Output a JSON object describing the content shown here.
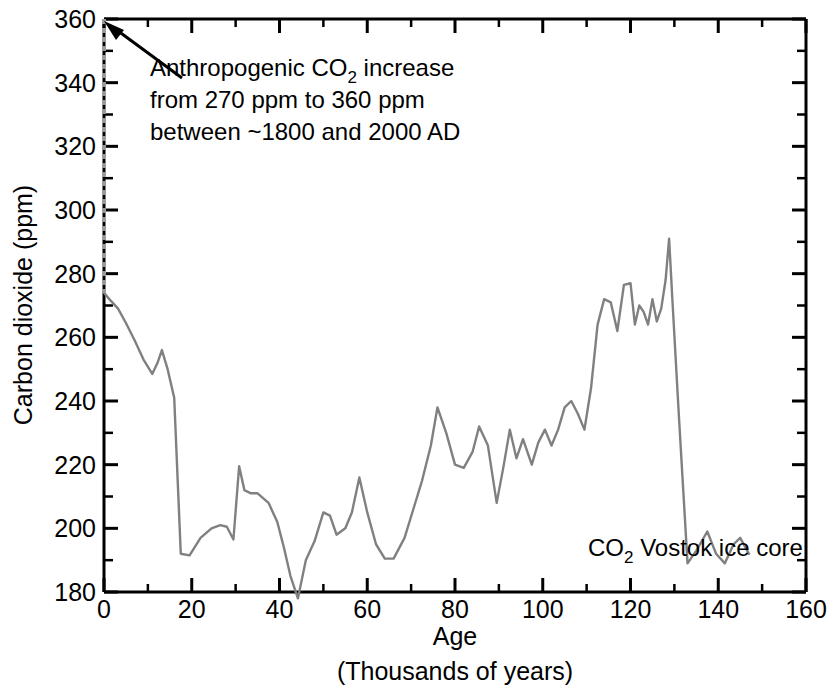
{
  "chart_data": {
    "type": "line",
    "title": "",
    "xlabel": "Age",
    "xlabel_sub": "(Thousands of years)",
    "ylabel_pre": "Carbon dioxide (ppm)",
    "xlim": [
      0,
      160
    ],
    "ylim": [
      180,
      360
    ],
    "x_major_ticks": [
      0,
      20,
      40,
      60,
      80,
      100,
      120,
      140,
      160
    ],
    "x_tick_labels": [
      "0",
      "20",
      "40",
      "60",
      "80",
      "100",
      "120",
      "140",
      "160"
    ],
    "x_minor_step": 10,
    "y_major_ticks": [
      180,
      200,
      220,
      240,
      260,
      280,
      300,
      320,
      340,
      360
    ],
    "y_tick_labels": [
      "180",
      "200",
      "220",
      "240",
      "260",
      "280",
      "300",
      "320",
      "340",
      "360"
    ],
    "y_minor_step": 10,
    "grid": false,
    "legend_position": "inside-bottom-right",
    "line_color": "#808080",
    "axis_color": "#000000",
    "series": [
      {
        "name": "CO2 Vostok ice core",
        "name_display_pre": "CO",
        "name_display_sub": "2",
        "name_display_post": " Vostok ice core",
        "x": [
          0.0,
          1.2,
          3.2,
          5.0,
          7.0,
          9.0,
          11.0,
          12.2,
          13.2,
          14.5,
          16.0,
          17.5,
          19.5,
          22.0,
          24.5,
          26.5,
          28.0,
          29.5,
          30.8,
          32.0,
          33.5,
          35.0,
          37.5,
          39.5,
          41.0,
          42.5,
          44.2,
          46.0,
          48.0,
          50.0,
          51.5,
          53.0,
          55.0,
          56.5,
          58.2,
          60.0,
          62.0,
          64.0,
          66.0,
          68.5,
          70.5,
          72.5,
          74.5,
          76.0,
          78.0,
          80.0,
          82.0,
          84.0,
          85.5,
          87.5,
          89.5,
          91.0,
          92.5,
          94.0,
          95.5,
          97.5,
          99.0,
          100.5,
          102.0,
          103.5,
          105.0,
          106.5,
          108.0,
          109.5,
          111.0,
          112.5,
          114.0,
          115.5,
          117.0,
          118.5,
          120.0,
          121.0,
          122.0,
          123.0,
          124.0,
          125.0,
          126.0,
          127.0,
          128.0,
          128.8,
          129.5,
          131.0,
          133.0,
          135.0,
          137.5,
          139.5,
          141.5,
          143.5,
          145.0,
          147.0
        ],
        "y": [
          274.0,
          272.0,
          269.0,
          264.5,
          259.0,
          253.0,
          248.5,
          252.0,
          256.0,
          250.0,
          241.0,
          192.0,
          191.5,
          197.0,
          200.0,
          201.0,
          200.5,
          196.5,
          219.5,
          212.0,
          211.0,
          211.0,
          208.0,
          202.0,
          194.0,
          185.0,
          178.0,
          190.0,
          196.0,
          205.0,
          204.0,
          198.0,
          200.0,
          205.0,
          216.0,
          205.0,
          195.0,
          190.5,
          190.5,
          197.0,
          206.0,
          215.0,
          226.0,
          238.0,
          230.0,
          220.0,
          219.0,
          224.0,
          232.0,
          226.0,
          208.0,
          219.0,
          231.0,
          222.0,
          228.0,
          220.0,
          227.0,
          231.0,
          226.0,
          231.0,
          238.0,
          240.0,
          236.0,
          231.0,
          244.0,
          264.0,
          272.0,
          271.0,
          262.0,
          276.5,
          277.0,
          264.0,
          270.0,
          268.0,
          264.0,
          272.0,
          265.0,
          269.0,
          278.0,
          291.0,
          273.0,
          236.0,
          189.0,
          193.0,
          199.0,
          192.0,
          189.0,
          195.0,
          197.0,
          192.0
        ]
      }
    ],
    "annotations": [
      {
        "id": "anthropogenic-note",
        "lines": [
          {
            "pre": "Anthropogenic CO",
            "sub": "2",
            "post": " increase"
          },
          {
            "pre": "from 270 ppm to 360 ppm",
            "sub": "",
            "post": ""
          },
          {
            "pre": "between ~1800 and 2000 AD",
            "sub": "",
            "post": ""
          }
        ],
        "arrow_from_x": 182,
        "arrow_from_y": 78,
        "arrow_to_x": 108,
        "arrow_to_y": 24
      }
    ],
    "anthropogenic_spike": {
      "x": 0.0,
      "y_from": 274,
      "y_to": 360,
      "description": "near-vertical dashed/grey rise at age 0 from 274 ppm up to 360 ppm"
    }
  }
}
